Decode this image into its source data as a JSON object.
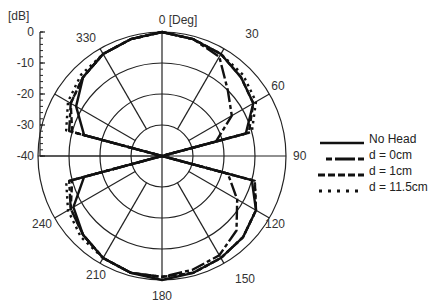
{
  "chart_data": {
    "type": "polar-line",
    "title": "",
    "angular_axis": {
      "label": "0 [Deg]",
      "direction": "clockwise",
      "zero_at": "top",
      "ticks": [
        "0",
        "30",
        "60",
        "90",
        "120",
        "150",
        "180",
        "210",
        "240",
        "330"
      ],
      "grid_step_deg": 30
    },
    "radial_axis": {
      "unit_label": "[dB]",
      "ticks": [
        0,
        -10,
        -20,
        -30,
        -40
      ],
      "range": [
        -40,
        0
      ],
      "grid": true
    },
    "legend_position": "right",
    "series": [
      {
        "name": "No Head",
        "style": "solid",
        "angles": [
          0,
          15,
          30,
          45,
          60,
          75,
          90,
          105,
          120,
          135,
          150,
          165,
          180,
          195,
          210,
          225,
          240,
          255,
          270,
          285,
          300,
          315,
          330,
          345
        ],
        "values": [
          0,
          -1,
          -2,
          -4,
          -6,
          -12,
          -40,
          -10,
          -5,
          -3,
          -2,
          -1,
          0,
          -1,
          -2,
          -4,
          -7,
          -14,
          -40,
          -14,
          -8,
          -4,
          -2,
          -1
        ]
      },
      {
        "name": "d = 0cm",
        "style": "dash-dot-long",
        "angles": [
          0,
          15,
          30,
          45,
          60,
          75,
          90,
          105,
          120,
          135,
          150,
          165,
          180,
          195,
          210,
          225,
          240,
          255,
          270,
          285,
          300,
          315,
          330,
          345
        ],
        "values": [
          0,
          -1,
          -3,
          -10,
          -14,
          -22,
          -40,
          -18,
          -12,
          -6,
          -3,
          -2,
          -1,
          -1,
          -2,
          -4,
          -6,
          -9,
          -40,
          -9,
          -6,
          -4,
          -2,
          -1
        ]
      },
      {
        "name": "d = 1cm",
        "style": "dashed",
        "angles": [
          0,
          15,
          30,
          45,
          60,
          75,
          90,
          105,
          120,
          135,
          150,
          165,
          180,
          195,
          210,
          225,
          240,
          255,
          270,
          285,
          300,
          315,
          330,
          345
        ],
        "values": [
          0,
          -1,
          -2,
          -4,
          -6,
          -11,
          -40,
          -9,
          -5,
          -3,
          -2,
          -1,
          -1,
          -1,
          -2,
          -4,
          -6,
          -10,
          -40,
          -10,
          -6,
          -4,
          -2,
          -1
        ]
      },
      {
        "name": "d = 11.5cm",
        "style": "dotted",
        "angles": [
          0,
          15,
          30,
          45,
          60,
          75,
          90,
          105,
          120,
          135,
          150,
          165,
          180,
          195,
          210,
          225,
          240,
          255,
          270,
          285,
          300,
          315,
          330,
          345
        ],
        "values": [
          0,
          -1,
          -2,
          -3,
          -5,
          -10,
          -40,
          -9,
          -5,
          -3,
          -2,
          -1,
          -1,
          -1,
          -2,
          -3,
          -5,
          -8,
          -40,
          -8,
          -5,
          -3,
          -2,
          -1
        ]
      }
    ]
  },
  "legend": {
    "items": [
      {
        "label": "No Head"
      },
      {
        "label": "d = 0cm"
      },
      {
        "label": "d = 1cm"
      },
      {
        "label": "d = 11.5cm"
      }
    ]
  }
}
